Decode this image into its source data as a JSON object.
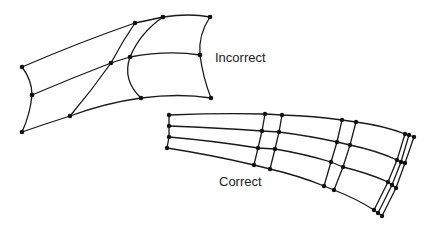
{
  "labels": {
    "incorrect": "Incorrect",
    "correct": "Correct"
  },
  "colors": {
    "line": "#1a1a1a",
    "node": "#111111",
    "background": "#ffffff"
  },
  "incorrect_mesh": {
    "rows": [
      [
        [
          22,
          67
        ],
        [
          135,
          23
        ],
        [
          163,
          17
        ],
        [
          210,
          17
        ]
      ],
      [
        [
          32,
          95
        ],
        [
          111,
          63
        ],
        [
          130,
          57
        ],
        [
          200,
          55
        ]
      ],
      [
        [
          22,
          132
        ],
        [
          70,
          116
        ],
        [
          141,
          98
        ],
        [
          211,
          98
        ]
      ]
    ]
  },
  "correct_mesh": {
    "columns": [
      [
        [
          169,
          115
        ],
        [
          169,
          126
        ],
        [
          169,
          137
        ],
        [
          167,
          148
        ]
      ],
      [
        [
          265,
          114
        ],
        [
          262,
          131
        ],
        [
          258,
          148
        ],
        [
          254,
          165
        ]
      ],
      [
        [
          282,
          115
        ],
        [
          279,
          132
        ],
        [
          275,
          149
        ],
        [
          270,
          169
        ]
      ],
      [
        [
          342,
          120
        ],
        [
          337,
          142
        ],
        [
          331,
          162
        ],
        [
          324,
          186
        ]
      ],
      [
        [
          356,
          122
        ],
        [
          350,
          145
        ],
        [
          343,
          167
        ],
        [
          334,
          190
        ]
      ],
      [
        [
          405,
          134
        ],
        [
          397,
          160
        ],
        [
          388,
          182
        ],
        [
          374,
          210
        ]
      ],
      [
        [
          409,
          135
        ],
        [
          401,
          162
        ],
        [
          392,
          185
        ],
        [
          378,
          213
        ]
      ],
      [
        [
          414,
          137
        ],
        [
          405,
          163
        ],
        [
          396,
          188
        ],
        [
          382,
          216
        ]
      ]
    ]
  }
}
